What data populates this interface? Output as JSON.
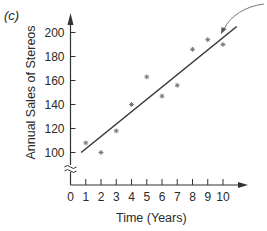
{
  "panel_label": "(c)",
  "chart_data": {
    "type": "scatter",
    "title": "",
    "xlabel": "Time (Years)",
    "ylabel": "Annual Sales of Stereos",
    "x_ticks": [
      0,
      1,
      2,
      3,
      4,
      5,
      6,
      7,
      8,
      9,
      10
    ],
    "y_ticks": [
      100,
      120,
      140,
      160,
      180,
      200
    ],
    "xlim": [
      0,
      11
    ],
    "ylim": [
      80,
      210
    ],
    "y_axis_break": true,
    "grid": false,
    "legend": null,
    "series": [
      {
        "name": "Observed sales",
        "marker": "asterisk",
        "x": [
          1,
          2,
          3,
          4,
          5,
          6,
          7,
          8,
          9,
          10
        ],
        "y": [
          108,
          100,
          118,
          140,
          163,
          147,
          156,
          186,
          194,
          190
        ]
      },
      {
        "name": "Trend line",
        "type": "line",
        "x": [
          0.7,
          10.9
        ],
        "y": [
          100,
          205
        ]
      }
    ],
    "annotations": [
      {
        "type": "curved-arrow",
        "from": "top-right corner",
        "to": "trend line near x=10, y≈199"
      }
    ]
  }
}
